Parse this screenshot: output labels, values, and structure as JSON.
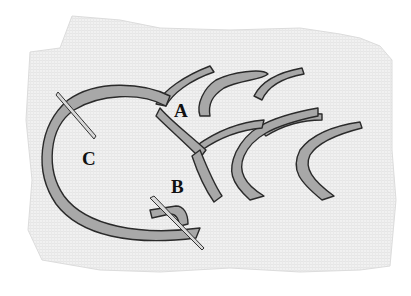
{
  "figure": {
    "labels": [
      {
        "id": "A",
        "text": "A",
        "x": 174,
        "y": 101
      },
      {
        "id": "B",
        "text": "B",
        "x": 171,
        "y": 177
      },
      {
        "id": "C",
        "text": "C",
        "x": 82,
        "y": 149
      }
    ],
    "colors": {
      "fabric": "#efefef",
      "thread": "#a8a8a8",
      "thread_outline": "#2a2a2a",
      "needle": "#d8d8d8"
    }
  }
}
